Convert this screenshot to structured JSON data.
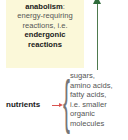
{
  "anabolism": {
    "title": "anabolism",
    "colon": ":",
    "line1": "energy-requiring",
    "line2": "reactions, i.e.",
    "emph1": "endergonic",
    "emph2": "reactions"
  },
  "nutrients": {
    "label": "nutrients",
    "items": [
      "sugars,",
      "amino acids,",
      "fatty acids,",
      "i.e. smaller",
      "organic",
      "molecules"
    ]
  },
  "colors": {
    "box_bg": "#fbf8d9",
    "up_arrow": "#2f6b3a",
    "nutrient_arrow": "#d9534f"
  }
}
